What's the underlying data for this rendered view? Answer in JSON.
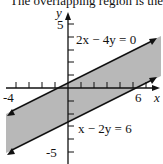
{
  "caption": "The overlapping region is the",
  "axes": {
    "x_label": "x",
    "y_label": "y",
    "x_ticks": {
      "min": -4,
      "max": 6,
      "labels": [
        "-4",
        "6"
      ]
    },
    "y_ticks": {
      "min": -5,
      "max": 5,
      "labels": [
        "5",
        "-5"
      ]
    }
  },
  "lines": [
    {
      "equation": "2x − 4y = 0",
      "slope": 0.5,
      "intercept": 0
    },
    {
      "equation": "x − 2y = 6",
      "slope": 0.5,
      "intercept": -3
    }
  ],
  "region": {
    "description": "shaded band between the two parallel lines",
    "fill": "#b8b8b8"
  },
  "colors": {
    "line": "#111111",
    "shade": "#b8b8b8",
    "background": "#ffffff"
  }
}
